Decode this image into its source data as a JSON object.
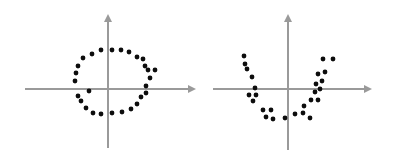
{
  "figure": {
    "title": "",
    "background_color": "#ffffff",
    "width": 401,
    "height": 161,
    "panel_count": 2
  },
  "style": {
    "axis_color": "#9a9a9a",
    "dot_color": "#0d0d0d",
    "dot_radius": 2.4,
    "axis_stroke_width": 2
  },
  "chart_data": [
    {
      "type": "scatter",
      "name": "circular-cluster",
      "title": "",
      "subtitle": "",
      "xlabel": "",
      "ylabel": "",
      "legend": [],
      "annotations": [],
      "grid": false,
      "axes": {
        "style": "cartesian-arrows",
        "origin_px": [
          108,
          89
        ],
        "x_axis_px": {
          "x1": 25,
          "x2": 196,
          "y": 89,
          "arrow": "right"
        },
        "y_axis_px": {
          "y1": 148,
          "y2": 14,
          "x": 108,
          "arrow": "up"
        },
        "xlim": [
          -3,
          3
        ],
        "ylim": [
          -3,
          3
        ],
        "xticks": [],
        "yticks": []
      },
      "shape_description": "points scattered around a ring / circle centered at the origin",
      "n_points": 28,
      "points_px": [
        [
          92,
          54
        ],
        [
          101,
          50
        ],
        [
          112,
          50
        ],
        [
          121,
          50
        ],
        [
          129,
          52
        ],
        [
          83,
          58
        ],
        [
          137,
          57
        ],
        [
          143,
          59
        ],
        [
          78,
          66
        ],
        [
          145,
          66
        ],
        [
          76,
          73
        ],
        [
          148,
          70
        ],
        [
          155,
          70
        ],
        [
          75,
          81
        ],
        [
          150,
          78
        ],
        [
          146,
          86
        ],
        [
          78,
          96
        ],
        [
          146,
          93
        ],
        [
          81,
          101
        ],
        [
          141,
          97
        ],
        [
          86,
          108
        ],
        [
          137,
          104
        ],
        [
          93,
          113
        ],
        [
          131,
          109
        ],
        [
          101,
          114
        ],
        [
          122,
          112
        ],
        [
          112,
          113
        ],
        [
          89,
          91
        ]
      ],
      "points_data": [
        [
          -0.55,
          1.21
        ],
        [
          -0.24,
          1.35
        ],
        [
          0.14,
          1.35
        ],
        [
          0.45,
          1.35
        ],
        [
          0.73,
          1.28
        ],
        [
          -0.86,
          1.07
        ],
        [
          1.0,
          1.1
        ],
        [
          1.2,
          1.03
        ],
        [
          -1.03,
          0.79
        ],
        [
          1.27,
          0.79
        ],
        [
          -1.1,
          0.55
        ],
        [
          1.37,
          0.65
        ],
        [
          1.61,
          0.65
        ],
        [
          -1.13,
          0.28
        ],
        [
          1.44,
          0.38
        ],
        [
          1.3,
          0.1
        ],
        [
          -1.03,
          -0.24
        ],
        [
          1.3,
          -0.14
        ],
        [
          -0.93,
          -0.41
        ],
        [
          1.13,
          -0.28
        ],
        [
          -0.76,
          -0.65
        ],
        [
          1.0,
          -0.52
        ],
        [
          -0.52,
          -0.83
        ],
        [
          0.79,
          -0.69
        ],
        [
          -0.24,
          -0.86
        ],
        [
          0.48,
          -0.79
        ],
        [
          0.14,
          -0.83
        ],
        [
          -0.65,
          -0.07
        ]
      ]
    },
    {
      "type": "scatter",
      "name": "parabolic-cluster",
      "title": "",
      "subtitle": "",
      "xlabel": "",
      "ylabel": "",
      "legend": [],
      "annotations": [],
      "grid": false,
      "axes": {
        "style": "cartesian-arrows",
        "origin_px": [
          288,
          89
        ],
        "x_axis_px": {
          "x1": 213,
          "x2": 372,
          "y": 89,
          "arrow": "right"
        },
        "y_axis_px": {
          "y1": 150,
          "y2": 14,
          "x": 288,
          "arrow": "up"
        },
        "xlim": [
          -3,
          3
        ],
        "ylim": [
          -3,
          3
        ],
        "xticks": [],
        "yticks": []
      },
      "shape_description": "points scattered along a U-shaped parabola opening upward, vertex below the origin",
      "n_points": 27,
      "points_px": [
        [
          244,
          56
        ],
        [
          245,
          64
        ],
        [
          247,
          69
        ],
        [
          252,
          77
        ],
        [
          255,
          88
        ],
        [
          249,
          95
        ],
        [
          256,
          95
        ],
        [
          253,
          101
        ],
        [
          263,
          110
        ],
        [
          271,
          110
        ],
        [
          266,
          117
        ],
        [
          273,
          119
        ],
        [
          285,
          118
        ],
        [
          295,
          114
        ],
        [
          303,
          113
        ],
        [
          310,
          118
        ],
        [
          304,
          106
        ],
        [
          311,
          100
        ],
        [
          318,
          100
        ],
        [
          315,
          92
        ],
        [
          320,
          89
        ],
        [
          316,
          84
        ],
        [
          322,
          81
        ],
        [
          318,
          74
        ],
        [
          325,
          72
        ],
        [
          323,
          59
        ],
        [
          333,
          59
        ]
      ],
      "points_data": [
        [
          -1.47,
          1.1
        ],
        [
          -1.43,
          0.83
        ],
        [
          -1.37,
          0.66
        ],
        [
          -1.2,
          0.41
        ],
        [
          -1.1,
          0.03
        ],
        [
          -1.3,
          -0.21
        ],
        [
          -1.07,
          -0.21
        ],
        [
          -1.17,
          -0.41
        ],
        [
          -0.83,
          -0.72
        ],
        [
          -0.57,
          -0.72
        ],
        [
          -0.73,
          -0.93
        ],
        [
          -0.5,
          -1.0
        ],
        [
          -0.1,
          -0.97
        ],
        [
          0.23,
          -0.83
        ],
        [
          0.5,
          -0.79
        ],
        [
          0.73,
          -0.97
        ],
        [
          0.53,
          -0.57
        ],
        [
          0.77,
          -0.38
        ],
        [
          1.0,
          -0.38
        ],
        [
          0.9,
          -0.1
        ],
        [
          1.07,
          0.0
        ],
        [
          0.93,
          0.17
        ],
        [
          1.13,
          0.28
        ],
        [
          1.0,
          0.52
        ],
        [
          1.23,
          0.59
        ],
        [
          1.17,
          1.03
        ],
        [
          1.5,
          1.03
        ]
      ]
    }
  ]
}
